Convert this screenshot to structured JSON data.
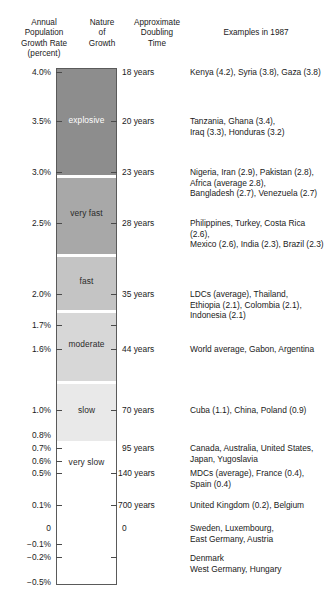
{
  "headers": {
    "rate": "Annual\nPopulation\nGrowth Rate\n(percent)",
    "rate_lines": [
      "Annual",
      "Population",
      "Growth Rate",
      "(percent)"
    ],
    "nature_lines": [
      "Nature",
      "of",
      "Growth"
    ],
    "doubling_lines": [
      "Approximate",
      "Doubling",
      "Time"
    ],
    "examples": "Examples in 1987"
  },
  "chart_data": {
    "type": "bar",
    "xlabel": "",
    "ylabel": "Annual Population Growth Rate (percent)",
    "ylim": [
      -0.5,
      4.0
    ],
    "grid": false,
    "legend": "none",
    "orientation": "vertical-scale",
    "axis_ticks": [
      {
        "label": "4.0%",
        "value": 4.0,
        "y": 72,
        "tick_left": true,
        "tick_right": false
      },
      {
        "label": "3.5%",
        "value": 3.5,
        "y": 121,
        "tick_left": true,
        "tick_right": true
      },
      {
        "label": "3.0%",
        "value": 3.0,
        "y": 172,
        "tick_left": true,
        "tick_right": true
      },
      {
        "label": "2.5%",
        "value": 2.5,
        "y": 223,
        "tick_left": true,
        "tick_right": true
      },
      {
        "label": "2.0%",
        "value": 2.0,
        "y": 294,
        "tick_left": true,
        "tick_right": true
      },
      {
        "label": "1.7%",
        "value": 1.7,
        "y": 325,
        "tick_left": true,
        "tick_right": true
      },
      {
        "label": "1.6%",
        "value": 1.6,
        "y": 349,
        "tick_left": true,
        "tick_right": true
      },
      {
        "label": "1.0%",
        "value": 1.0,
        "y": 410,
        "tick_left": true,
        "tick_right": true
      },
      {
        "label": "0.8%",
        "value": 0.8,
        "y": 435,
        "tick_left": false,
        "tick_right": false
      },
      {
        "label": "0.7%",
        "value": 0.7,
        "y": 448,
        "tick_left": true,
        "tick_right": false
      },
      {
        "label": "0.6%",
        "value": 0.6,
        "y": 461,
        "tick_left": true,
        "tick_right": false
      },
      {
        "label": "0.5%",
        "value": 0.5,
        "y": 473,
        "tick_left": true,
        "tick_right": true
      },
      {
        "label": "0.1%",
        "value": 0.1,
        "y": 505,
        "tick_left": true,
        "tick_right": true
      },
      {
        "label": "0",
        "value": 0.0,
        "y": 528,
        "tick_left": false,
        "tick_right": false
      },
      {
        "label": "−0.1%",
        "value": -0.1,
        "y": 544,
        "tick_left": true,
        "tick_right": false
      },
      {
        "label": "−0.2%",
        "value": -0.2,
        "y": 557,
        "tick_left": true,
        "tick_right": true
      },
      {
        "label": "−0.5%",
        "value": -0.5,
        "y": 582,
        "tick_left": false,
        "tick_right": false
      }
    ],
    "bands": [
      {
        "name": "explosive",
        "label": "explosive",
        "top": 0,
        "height": 106,
        "color": "#8d8d8d",
        "text_color": "#ffffff",
        "label_y": 46,
        "range": [
          3.0,
          4.0
        ]
      },
      {
        "name": "very fast",
        "label": "very fast",
        "top": 109,
        "height": 76,
        "color": "#a8a8a8",
        "text_color": "#2a2a2a",
        "label_y": 30,
        "range": [
          2.0,
          3.0
        ]
      },
      {
        "name": "fast",
        "label": "fast",
        "top": 188,
        "height": 53,
        "color": "#c4c4c4",
        "text_color": "#2a2a2a",
        "label_y": 19,
        "range": [
          1.6,
          2.0
        ]
      },
      {
        "name": "moderate",
        "label": "moderate",
        "top": 244,
        "height": 68,
        "color": "#d7d7d7",
        "text_color": "#2a2a2a",
        "label_y": 26,
        "range": [
          1.0,
          1.6
        ]
      },
      {
        "name": "slow",
        "label": "slow",
        "top": 315,
        "height": 57,
        "color": "#e9e9e9",
        "text_color": "#2a2a2a",
        "label_y": 21,
        "range": [
          0.5,
          1.0
        ]
      },
      {
        "name": "very slow",
        "label": "very slow",
        "top": 375,
        "height": 140,
        "color": "#ffffff",
        "text_color": "#2a2a2a",
        "label_y": 13,
        "range": [
          -0.5,
          0.5
        ]
      }
    ],
    "doubling_times": [
      {
        "label": "18 years",
        "years": 18,
        "y": 68,
        "rate": 4.0
      },
      {
        "label": "20 years",
        "years": 20,
        "y": 117,
        "rate": 3.5
      },
      {
        "label": "23 years",
        "years": 23,
        "y": 168,
        "rate": 3.0
      },
      {
        "label": "28 years",
        "years": 28,
        "y": 219,
        "rate": 2.5
      },
      {
        "label": "35 years",
        "years": 35,
        "y": 290,
        "rate": 2.0
      },
      {
        "label": "44 years",
        "years": 44,
        "y": 345,
        "rate": 1.6
      },
      {
        "label": "70 years",
        "years": 70,
        "y": 406,
        "rate": 1.0
      },
      {
        "label": "95 years",
        "years": 95,
        "y": 444,
        "rate": 0.7
      },
      {
        "label": "140 years",
        "years": 140,
        "y": 469,
        "rate": 0.5
      },
      {
        "label": "700 years",
        "years": 700,
        "y": 501,
        "rate": 0.1
      },
      {
        "label": "0",
        "years": 0,
        "y": 524,
        "rate": 0.0
      }
    ],
    "examples": [
      {
        "y": 67,
        "lines": [
          "Kenya (4.2), Syria (3.8), Gaza (3.8)"
        ]
      },
      {
        "y": 116,
        "lines": [
          "Tanzania, Ghana (3.4),",
          "Iraq (3.3), Honduras (3.2)"
        ]
      },
      {
        "y": 167,
        "lines": [
          "Nigeria, Iran (2.9), Pakistan (2.8),",
          "Africa (average 2.8),",
          "Bangladesh (2.7), Venezuela (2.7)"
        ]
      },
      {
        "y": 218,
        "lines": [
          "Philippines, Turkey, Costa Rica (2.6),",
          "Mexico (2.6), India (2.3), Brazil (2.3)"
        ]
      },
      {
        "y": 289,
        "lines": [
          "LDCs (average), Thailand,",
          "Ethiopia (2.1), Colombia (2.1),",
          "Indonesia (2.1)"
        ]
      },
      {
        "y": 344,
        "lines": [
          "World average, Gabon, Argentina"
        ]
      },
      {
        "y": 405,
        "lines": [
          "Cuba (1.1), China, Poland (0.9)"
        ]
      },
      {
        "y": 443,
        "lines": [
          "Canada, Australia, United States,",
          "Japan, Yugoslavia"
        ]
      },
      {
        "y": 468,
        "lines": [
          "MDCs (average), France (0.4),",
          "Spain (0.4)"
        ]
      },
      {
        "y": 500,
        "lines": [
          "United Kingdom (0.2), Belgium"
        ]
      },
      {
        "y": 523,
        "lines": [
          "Sweden, Luxembourg,",
          "East Germany, Austria"
        ]
      },
      {
        "y": 553,
        "lines": [
          "Denmark",
          "West Germany, Hungary"
        ]
      }
    ]
  }
}
